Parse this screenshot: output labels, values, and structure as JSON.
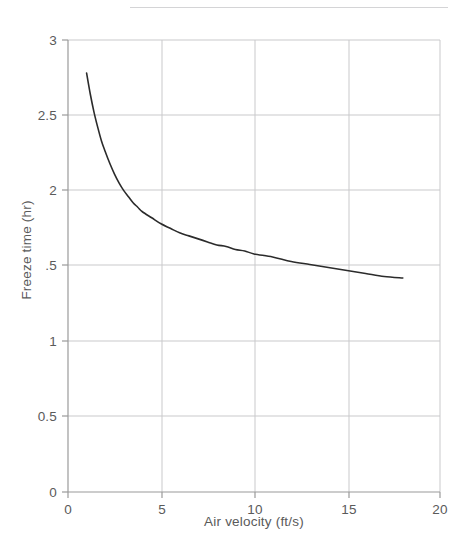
{
  "figure": {
    "has_top_rule": true,
    "background_color": "#ffffff",
    "axis_color": "#9a9a9a",
    "grid_color": "#c9c9cb",
    "curve_color": "#2b2b2b",
    "label_color": "#5a5a5a",
    "rule_color": "#d4d4d6"
  },
  "chart_data": {
    "type": "line",
    "title": "",
    "subtitle": "",
    "xlabel": "Air velocity (ft/s)",
    "ylabel": "Freeze time (hr)",
    "xlim": [
      0,
      20
    ],
    "ylim": [
      0,
      3
    ],
    "grid": true,
    "legend": null,
    "legend_position": "none",
    "xticks": [
      0,
      5,
      10,
      15,
      20
    ],
    "xtick_labels": [
      "0",
      "5",
      "10",
      "15",
      "20"
    ],
    "yticks": [
      0,
      0.5,
      1,
      1.5,
      2,
      2.5,
      3
    ],
    "ytick_labels": [
      "0",
      "0.5",
      "1",
      ".5",
      "2",
      "2.5",
      "3"
    ],
    "series": [
      {
        "name": "Freeze time vs air velocity",
        "x": [
          1.0,
          1.2,
          1.4,
          1.6,
          1.8,
          2.0,
          2.25,
          2.5,
          2.75,
          3.0,
          3.25,
          3.5,
          3.75,
          4.0,
          4.5,
          5.0,
          5.5,
          6.0,
          6.5,
          7.0,
          7.5,
          8.0,
          8.5,
          9.0,
          9.5,
          10.0,
          11.0,
          12.0,
          13.0,
          14.0,
          15.0,
          16.0,
          17.0,
          18.0
        ],
        "y": [
          2.78,
          2.64,
          2.52,
          2.42,
          2.33,
          2.26,
          2.18,
          2.11,
          2.05,
          2.0,
          1.96,
          1.92,
          1.89,
          1.86,
          1.82,
          1.78,
          1.75,
          1.72,
          1.7,
          1.68,
          1.66,
          1.64,
          1.63,
          1.61,
          1.6,
          1.58,
          1.56,
          1.53,
          1.51,
          1.49,
          1.47,
          1.45,
          1.43,
          1.42
        ]
      }
    ],
    "annotations": []
  }
}
